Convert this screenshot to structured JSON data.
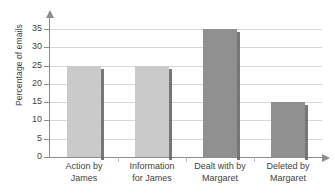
{
  "chart_data": {
    "type": "bar",
    "title": "",
    "xlabel": "",
    "ylabel": "Percentage of emails",
    "categories": [
      "Action by James",
      "Information for James",
      "Dealt with by Margaret",
      "Deleted by Margaret"
    ],
    "category_lines": [
      [
        "Action by",
        "James"
      ],
      [
        "Information",
        "for James"
      ],
      [
        "Dealt with by",
        "Margaret"
      ],
      [
        "Deleted by",
        "Margaret"
      ]
    ],
    "values": [
      25,
      25,
      35,
      15
    ],
    "bar_colors": [
      "#cacaca",
      "#cacaca",
      "#909090",
      "#909090"
    ],
    "ylim": [
      0,
      35
    ],
    "ytick_labels": [
      "0",
      "5",
      "10",
      "15",
      "20",
      "25",
      "30",
      "35"
    ],
    "ytick_values": [
      0,
      5,
      10,
      15,
      20,
      25,
      30,
      35
    ],
    "grid": true,
    "grid_color": "#d8d8d8",
    "axis_color": "#8d8d8d",
    "legend": null,
    "background": "#ffffff"
  }
}
